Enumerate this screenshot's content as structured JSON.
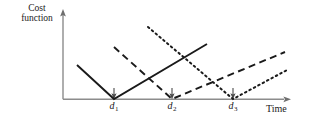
{
  "figure": {
    "axes": {
      "ylabel_line1": "Cost",
      "ylabel_line2": "function",
      "xlabel": "Time",
      "y_axis_name": "y-axis",
      "x_axis_name": "x-axis"
    },
    "tick_labels": [
      {
        "base": "d",
        "sub": "1"
      },
      {
        "base": "d",
        "sub": "2"
      },
      {
        "base": "d",
        "sub": "3"
      }
    ]
  },
  "chart_data": {
    "type": "line",
    "title": "",
    "xlabel": "Time",
    "ylabel": "Cost function",
    "grid": false,
    "legend": "none",
    "axis_style": {
      "y_arrow": true,
      "x_arrow": true,
      "axis_color": "#8c8c8c",
      "curve_color": "#1a1a1a"
    },
    "xticks": [
      "d_1",
      "d_2",
      "d_3"
    ],
    "xtick_positions": [
      114,
      172,
      233
    ],
    "yticks": [],
    "xlim": [
      63,
      290
    ],
    "ylim": [
      99,
      10
    ],
    "annotations": [
      {
        "name": "tick-arrow-d1",
        "x": 114,
        "y": 99,
        "direction": "down"
      },
      {
        "name": "tick-arrow-d2",
        "x": 172,
        "y": 99,
        "direction": "down"
      },
      {
        "name": "tick-arrow-d3",
        "x": 233,
        "y": 99,
        "direction": "down"
      }
    ],
    "series": [
      {
        "name": "job-1-cost",
        "style": "solid",
        "due_date": "d_1",
        "points": [
          [
            77,
            65
          ],
          [
            114,
            99
          ],
          [
            207,
            44
          ]
        ],
        "description": "V-shaped earliness/tardiness cost with minimum at d_1"
      },
      {
        "name": "job-2-cost",
        "style": "dashed",
        "due_date": "d_2",
        "points": [
          [
            114,
            47
          ],
          [
            172,
            99
          ],
          [
            285,
            52
          ]
        ],
        "description": "V-shaped earliness/tardiness cost with minimum at d_2"
      },
      {
        "name": "job-3-cost",
        "style": "dotted",
        "due_date": "d_3",
        "points": [
          [
            148,
            27
          ],
          [
            233,
            99
          ],
          [
            287,
            70
          ]
        ],
        "description": "V-shaped earliness/tardiness cost with minimum at d_3"
      }
    ]
  }
}
